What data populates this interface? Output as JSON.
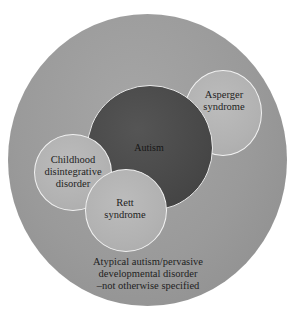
{
  "diagram": {
    "type": "nested-circle-diagram",
    "colors": {
      "background": "#ffffff",
      "outer_circle": "#9a9a9a",
      "autism_circle": "#484848",
      "subtype_circles": "#b2b2b2",
      "circle_border": "#f2f2f2",
      "text": "#1e1e1e"
    },
    "outer": {
      "lines": [
        "Atypical autism/pervasive",
        "developmental disorder",
        "–not otherwise specified"
      ]
    },
    "autism": {
      "label": "Autism"
    },
    "asperger": {
      "lines": [
        "Asperger",
        "syndrome"
      ]
    },
    "childhood": {
      "lines": [
        "Childhood",
        "disintegrative",
        "disorder"
      ]
    },
    "rett": {
      "lines": [
        "Rett",
        "syndrome"
      ]
    }
  }
}
